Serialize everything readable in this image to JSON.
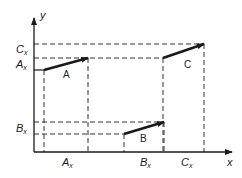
{
  "diagram": {
    "axes": {
      "x_label": "x",
      "y_label": "y"
    },
    "y_tick_labels": [
      {
        "main": "C",
        "sub": "x",
        "y": 47
      },
      {
        "main": "A",
        "sub": "x",
        "y": 62
      },
      {
        "main": "B",
        "sub": "x",
        "y": 126
      }
    ],
    "x_tick_labels": [
      {
        "main": "A",
        "sub": "x",
        "x": 63
      },
      {
        "main": "B",
        "sub": "x",
        "x": 143
      },
      {
        "main": "C",
        "sub": "x",
        "x": 183
      }
    ],
    "vectors": [
      {
        "name": "A",
        "label": "A"
      },
      {
        "name": "B",
        "label": "B"
      },
      {
        "name": "C",
        "label": "C"
      }
    ],
    "colors": {
      "line": "#1a1a1a",
      "background": "#ffffff"
    }
  }
}
